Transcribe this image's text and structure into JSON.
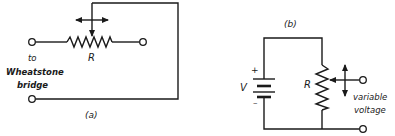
{
  "figure_a": {
    "caption": "(a)",
    "resistor_label": "R",
    "terminal_label_line1": "to",
    "terminal_label_line2": "Wheatstone",
    "terminal_label_line3": "bridge",
    "components": [
      "variable-resistor-rheostat",
      "wiper-horizontal-arrow",
      "terminals"
    ]
  },
  "figure_b": {
    "caption": "(b)",
    "battery_label": "V",
    "battery_plus": "+",
    "battery_minus": "–",
    "resistor_label": "R",
    "output_label_line1": "variable",
    "output_label_line2": "voltage",
    "components": [
      "battery",
      "potentiometer",
      "wiper-vertical-arrow",
      "output-terminals"
    ]
  },
  "colors": {
    "ink": "#1a1a1a",
    "background": "#ffffff"
  }
}
